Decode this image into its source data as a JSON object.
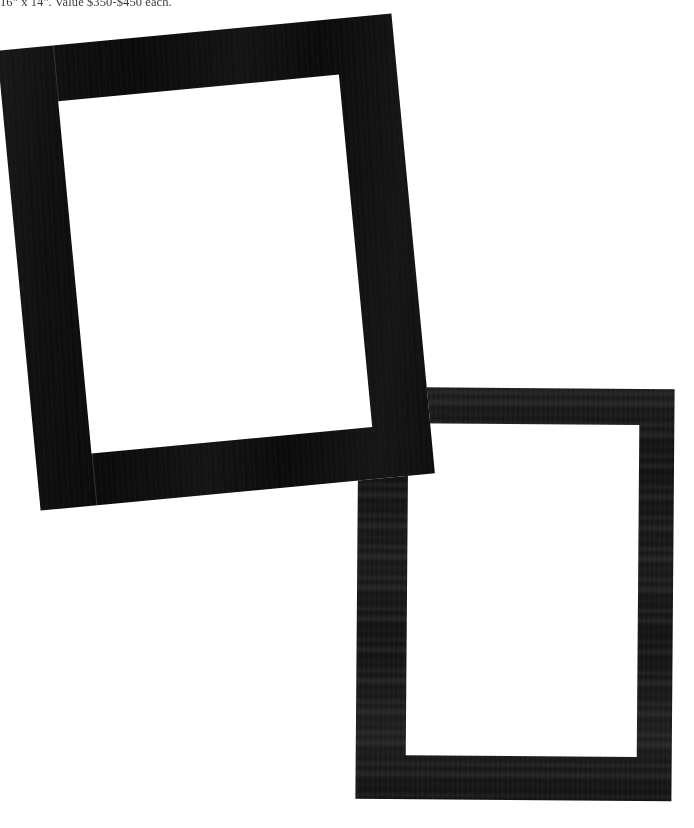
{
  "page": {
    "background_color": "#ffffff",
    "width": 694,
    "height": 828
  },
  "caption": {
    "text": "16\" x 14\". Value $350-$450 each.",
    "color": "#2b2b2b",
    "clipped": "top edge of line is cropped by the page boundary"
  },
  "photograph": {
    "subject": "two empty black picture frames overlapping on a plain white background",
    "frames": [
      {
        "id": "frame-one",
        "position_label": "upper-left",
        "orientation": "portrait, tilted counter-clockwise",
        "rotation_degrees": -5.4,
        "molding_color": "#0b0a0a",
        "opening_color": "#ffffff",
        "outer_width_px": 396,
        "outer_height_px": 462,
        "molding_width_px": 56,
        "finish": "matte black wood with faint vertical grain"
      },
      {
        "id": "frame-two",
        "position_label": "lower-right",
        "orientation": "portrait, nearly upright",
        "rotation_degrees": 0.45,
        "molding_color": "#100f0f",
        "opening_color": "#ffffff",
        "outer_width_px": 316,
        "outer_height_px": 412,
        "molding_width_px": 40,
        "finish": "black wood with banded horizontal grain texture"
      }
    ],
    "overlap_note": "frame-one's lower-right corner rests over frame-two's upper-left corner"
  }
}
